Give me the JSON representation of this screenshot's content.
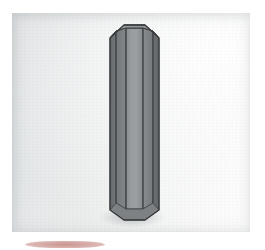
{
  "image": {
    "title": "Hexagonal prism photograph",
    "description": "Photograph of a tall gray hexagonal prism standing upright on a light gray studio background",
    "width": 265,
    "height": 250,
    "background_color": "#ffffff"
  },
  "panel": {
    "name": "photo-panel",
    "left": 12,
    "top": 13,
    "width": 238,
    "height": 219,
    "background_light": "#fdfdfd",
    "background_mid": "#eaecec",
    "background_dark": "#d9dcdd",
    "lighting": "soft gradient, brightest at upper right, slightly gray toward lower left"
  },
  "object": {
    "name": "hexagonal-prism",
    "shape": "hexagonal prism",
    "orientation": "vertical / upright",
    "top_cap": "visible hexagonal top face seen from slightly above",
    "bottom_end": "chamfered / beveled point",
    "outline_color": "#3a3c3e",
    "faces": [
      {
        "name": "top-cap-face",
        "tone": "#8f9294",
        "note": "lightest, top hexagon"
      },
      {
        "name": "left-edge-face",
        "tone": "#6f7375",
        "note": "narrow dark sliver at far left"
      },
      {
        "name": "left-face",
        "tone": "#7b7f81",
        "note": "medium dark"
      },
      {
        "name": "front-face",
        "tone": "#92969a",
        "note": "widest, mid tone facing viewer"
      },
      {
        "name": "right-face",
        "tone": "#7f8386",
        "note": "medium"
      },
      {
        "name": "right-edge-face",
        "tone": "#6b6f71",
        "note": "narrow dark sliver at far right"
      }
    ],
    "bounds": {
      "left": 110,
      "top": 28,
      "right": 156,
      "bottom": 219
    }
  },
  "accent": {
    "name": "rose-band",
    "description": "faint dusty rose horizontal smudge below the photo panel",
    "color": "#ba7670",
    "left": 25,
    "top": 241,
    "width": 80,
    "height": 7
  }
}
